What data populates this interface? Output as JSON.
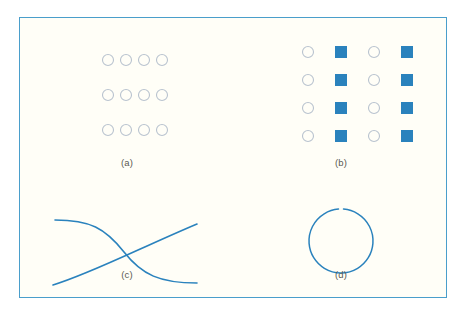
{
  "figure": {
    "background_color": "#fffef7",
    "frame_color": "#4a9ecb",
    "accent_blue": "#2a82bd",
    "marker_outline_color": "#b9c3cf",
    "label_color": "#5a5a52"
  },
  "panels": [
    {
      "id": "a",
      "label": "(a)",
      "type": "marker-grid",
      "description": "grid of open circles",
      "rows": 3,
      "cols": 4,
      "marker_sequence": [
        "circle-open",
        "circle-open",
        "circle-open",
        "circle-open"
      ],
      "marker_size": 11,
      "col_spacing": 18,
      "row_spacing": 35,
      "origin_x": 88,
      "origin_y": 42
    },
    {
      "id": "b",
      "label": "(b)",
      "type": "marker-grid",
      "description": "grid alternating open circles and filled squares",
      "rows": 4,
      "cols": 4,
      "marker_sequence": [
        "circle-open",
        "square-filled",
        "circle-open",
        "square-filled"
      ],
      "marker_size": 11,
      "square_size": 12,
      "col_spacing": 33,
      "row_spacing": 28,
      "origin_x": 74,
      "origin_y": 34
    },
    {
      "id": "c",
      "label": "(c)",
      "type": "curves",
      "description": "two crossing curves",
      "curves": [
        {
          "name": "descending-sigmoid",
          "path": "M 35,42 C 70,42 85,50 104,74 C 122,97 140,105 177,105"
        },
        {
          "name": "ascending-curve",
          "path": "M 33,107 C 70,96 120,70 177,46"
        }
      ],
      "stroke_width": 1.6
    },
    {
      "id": "d",
      "label": "(d)",
      "type": "circle-outline",
      "description": "large open circle with small gap at top",
      "center_x": 107,
      "center_y": 63,
      "radius": 32,
      "gap_degrees": 9,
      "stroke_width": 1.5
    }
  ],
  "chart_data": {
    "type": "scatter",
    "title": "",
    "xlabel": "",
    "ylabel": "",
    "subplots": [
      {
        "panel": "(a)",
        "type": "marker-grid",
        "rows": 3,
        "cols": 4,
        "total_markers": 12,
        "marker_styles": [
          "circle-open"
        ],
        "legend": [],
        "grid": false
      },
      {
        "panel": "(b)",
        "type": "marker-grid",
        "rows": 4,
        "cols": 4,
        "total_markers": 16,
        "marker_styles": [
          "circle-open",
          "square-filled"
        ],
        "pattern": "columns alternate: open circle, filled square, open circle, filled square",
        "legend": [],
        "grid": false
      },
      {
        "panel": "(c)",
        "type": "line",
        "series": [
          {
            "name": "decreasing",
            "x": [
              0,
              0.15,
              0.3,
              0.45,
              0.5,
              0.6,
              0.75,
              0.9,
              1.0
            ],
            "y": [
              1.0,
              1.0,
              0.95,
              0.72,
              0.6,
              0.42,
              0.2,
              0.08,
              0.05
            ]
          },
          {
            "name": "increasing",
            "x": [
              0,
              0.15,
              0.3,
              0.45,
              0.5,
              0.6,
              0.75,
              0.9,
              1.0
            ],
            "y": [
              0.0,
              0.14,
              0.3,
              0.48,
              0.56,
              0.68,
              0.82,
              0.92,
              0.98
            ]
          }
        ],
        "xlim": [
          0,
          1
        ],
        "ylim": [
          0,
          1
        ],
        "grid": false,
        "legend": []
      },
      {
        "panel": "(d)",
        "type": "scatter",
        "shape": "circle-outline",
        "radius": 32,
        "grid": false,
        "legend": []
      }
    ]
  }
}
